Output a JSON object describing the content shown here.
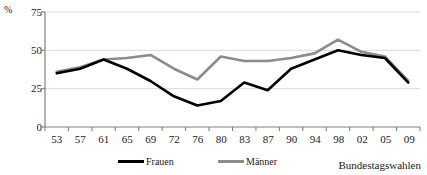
{
  "chart_data": {
    "type": "line",
    "title": "",
    "xlabel": "Bundestagswahlen",
    "ylabel": "%",
    "ylim": [
      0,
      75
    ],
    "yticks": [
      0,
      25,
      50,
      75
    ],
    "grid": true,
    "legend_position": "bottom",
    "categories": [
      "53",
      "57",
      "61",
      "65",
      "69",
      "72",
      "76",
      "80",
      "83",
      "87",
      "90",
      "94",
      "98",
      "02",
      "05",
      "09"
    ],
    "series": [
      {
        "name": "Frauen",
        "color": "#000000",
        "values": [
          35,
          38,
          44,
          38,
          30,
          20,
          14,
          17,
          29,
          24,
          38,
          44,
          50,
          47,
          45,
          29
        ]
      },
      {
        "name": "Männer",
        "color": "#8c8c8c",
        "values": [
          36,
          39,
          44,
          45,
          47,
          38,
          31,
          46,
          43,
          43,
          45,
          48,
          57,
          49,
          46,
          30
        ]
      }
    ]
  },
  "axis": {
    "y_unit": "%",
    "y_tick_labels": [
      "75",
      "50",
      "25",
      "0"
    ],
    "x_tick_labels": [
      "53",
      "57",
      "61",
      "65",
      "69",
      "72",
      "76",
      "80",
      "83",
      "87",
      "90",
      "94",
      "98",
      "02",
      "05",
      "09"
    ],
    "x_axis_title": "Bundestagswahlen"
  },
  "legend": {
    "items": [
      {
        "label": "Frauen",
        "color": "#000000"
      },
      {
        "label": "Männer",
        "color": "#8c8c8c"
      }
    ]
  }
}
